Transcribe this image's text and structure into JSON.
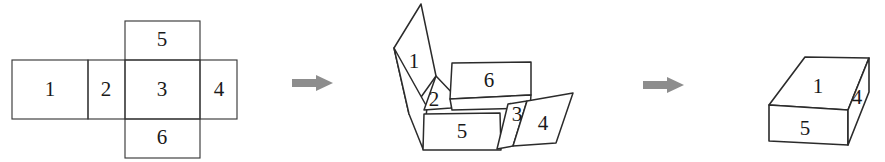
{
  "figure": {
    "stroke_color": "#2b2b2b",
    "arrow_color": "#8d8d8d",
    "background_color": "#ffffff"
  },
  "net": {
    "caption": "Flat cube net",
    "faces": [
      {
        "label": "1",
        "position": "left",
        "cx": 50,
        "cy": 90
      },
      {
        "label": "2",
        "position": "left-inner",
        "cx": 106,
        "cy": 90
      },
      {
        "label": "3",
        "position": "center",
        "cx": 162,
        "cy": 90
      },
      {
        "label": "4",
        "position": "right",
        "cx": 219,
        "cy": 90
      },
      {
        "label": "5",
        "position": "top",
        "cx": 162,
        "cy": 41
      },
      {
        "label": "6",
        "position": "bottom",
        "cx": 162,
        "cy": 139
      }
    ]
  },
  "folding": {
    "caption": "Partially folded net",
    "faces": [
      {
        "label": "1",
        "cx": 414,
        "cy": 63
      },
      {
        "label": "2",
        "cx": 434,
        "cy": 101
      },
      {
        "label": "6",
        "cx": 489,
        "cy": 82
      },
      {
        "label": "5",
        "cx": 462,
        "cy": 133
      },
      {
        "label": "3",
        "cx": 518,
        "cy": 116
      },
      {
        "label": "4",
        "cx": 543,
        "cy": 125
      }
    ]
  },
  "cube": {
    "caption": "Folded box",
    "faces": [
      {
        "label": "1",
        "position": "top",
        "cx": 818,
        "cy": 88
      },
      {
        "label": "4",
        "position": "right",
        "cx": 856,
        "cy": 98
      },
      {
        "label": "5",
        "position": "front",
        "cx": 805,
        "cy": 131
      }
    ]
  },
  "arrows": [
    {
      "name": "arrow-1",
      "x": 292,
      "y": 82
    },
    {
      "name": "arrow-2",
      "x": 643,
      "y": 84
    }
  ]
}
